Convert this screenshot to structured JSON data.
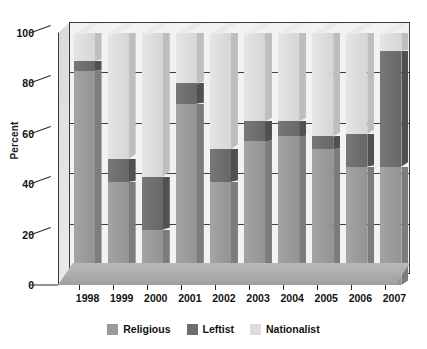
{
  "chart_data": {
    "type": "bar",
    "subtype": "stacked-bar-3d",
    "title": "",
    "xlabel": "",
    "ylabel": "Percent",
    "ylim": [
      0,
      100
    ],
    "yticks": [
      0,
      20,
      40,
      60,
      80,
      100
    ],
    "ytick_labels": [
      "0",
      "20",
      "40",
      "60",
      "80",
      "100"
    ],
    "grid": true,
    "grid_axis": "y",
    "legend_position": "bottom",
    "categories": [
      "1998",
      "1999",
      "2000",
      "2001",
      "2002",
      "2003",
      "2004",
      "2005",
      "2006",
      "2007"
    ],
    "series": [
      {
        "name": "Religious",
        "color": "#9a9a9a",
        "values": [
          85,
          41,
          22,
          72,
          41,
          57,
          59,
          54,
          47,
          47
        ]
      },
      {
        "name": "Leftist",
        "color": "#6e6e6e",
        "values": [
          4,
          9,
          21,
          8,
          13,
          8,
          6,
          5,
          13,
          46
        ]
      },
      {
        "name": "Nationalist",
        "color": "#dcdcdc",
        "values": [
          11,
          50,
          57,
          20,
          46,
          35,
          35,
          41,
          40,
          7
        ]
      }
    ],
    "cumulative_tops": {
      "Religious": [
        85,
        41,
        22,
        72,
        41,
        57,
        59,
        54,
        47,
        47
      ],
      "Leftist": [
        89,
        50,
        43,
        80,
        54,
        65,
        65,
        59,
        60,
        93
      ],
      "Nationalist": [
        100,
        100,
        100,
        100,
        100,
        100,
        100,
        100,
        100,
        100
      ]
    }
  },
  "legend": {
    "items": [
      {
        "label": "Religious",
        "color": "#9a9a9a"
      },
      {
        "label": "Leftist",
        "color": "#6e6e6e"
      },
      {
        "label": "Nationalist",
        "color": "#dcdcdc"
      }
    ]
  },
  "axes": {
    "y_title": "Percent"
  },
  "colors": {
    "religious": "#9a9a9a",
    "leftist": "#6e6e6e",
    "nationalist": "#dcdcdc",
    "background": "#ffffff",
    "plot_background": "#f2f2f2",
    "axis": "#2a2a2a",
    "gridline": "#3f3f3f",
    "floor": "#a9a9a9"
  }
}
